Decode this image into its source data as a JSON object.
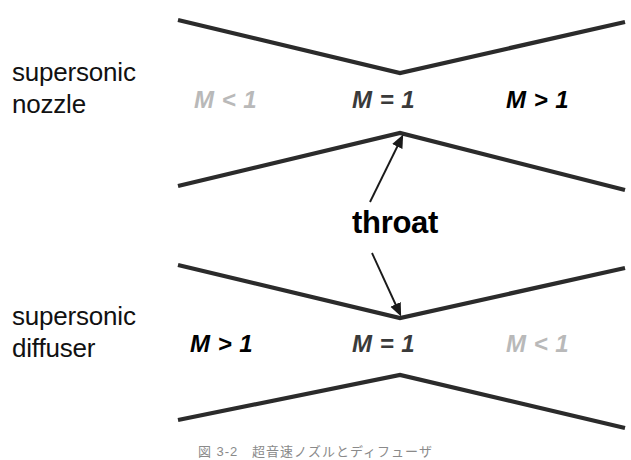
{
  "figure": {
    "width": 631,
    "height": 460,
    "background": "#ffffff",
    "caption": "図 3-2　超音速ノズルとディフューザ"
  },
  "colors": {
    "wall": "#2b2b2b",
    "arrow": "#1a1a1a",
    "mach_subsonic": "#b9b9b9",
    "mach_sonic": "#3a3a3a",
    "mach_supersonic": "#000000",
    "text": "#111111",
    "caption": "#8a8a8a"
  },
  "sections": {
    "nozzle": {
      "side_label": "supersonic\nnozzle",
      "mach_left": "M < 1",
      "mach_center": "M = 1",
      "mach_right": "M > 1"
    },
    "diffuser": {
      "side_label": "supersonic\ndiffuser",
      "mach_left": "M > 1",
      "mach_center": "M = 1",
      "mach_right": "M < 1"
    }
  },
  "annotations": {
    "throat_label": "throat"
  },
  "geometry": {
    "nozzle_upper_wall": "178,20 400,73 625,22",
    "nozzle_lower_wall": "178,186 400,133 625,190",
    "diffuser_upper_wall": "178,265 400,318 625,268",
    "diffuser_lower_wall": "178,420 400,375 625,428",
    "arrow_up": {
      "x1": 370,
      "y1": 202,
      "x2": 402,
      "y2": 136
    },
    "arrow_down": {
      "x1": 372,
      "y1": 253,
      "x2": 400,
      "y2": 316
    }
  }
}
